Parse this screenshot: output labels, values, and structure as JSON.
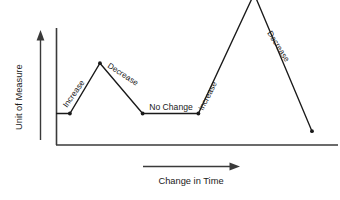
{
  "chart_data": {
    "type": "line",
    "title": "",
    "xlabel": "Change in Time",
    "ylabel": "Unit of Measure",
    "grid": false,
    "legend": "none",
    "axis_ticks": "none",
    "xlim": [
      0,
      100
    ],
    "ylim": [
      0,
      100
    ],
    "x": [
      0,
      5.4,
      17.1,
      33.7,
      55.4,
      77.1,
      99.6
    ],
    "y": [
      23.7,
      23.7,
      61.5,
      23.7,
      23.7,
      113.7,
      10.4
    ],
    "series": [
      {
        "name": "trend-line",
        "points": [
          {
            "x": 0,
            "y": 23.7
          },
          {
            "x": 5.4,
            "y": 23.7
          },
          {
            "x": 17.1,
            "y": 61.5
          },
          {
            "x": 33.7,
            "y": 23.7
          },
          {
            "x": 55.4,
            "y": 23.7
          },
          {
            "x": 77.1,
            "y": 113.7
          },
          {
            "x": 99.6,
            "y": 10.4
          }
        ]
      }
    ],
    "annotations": [
      {
        "text": "Increase",
        "segment": 1,
        "rotation": -55
      },
      {
        "text": "Decrease",
        "segment": 2,
        "rotation": 33
      },
      {
        "text": "No Change",
        "segment": 3,
        "rotation": 0
      },
      {
        "text": "Increase",
        "segment": 4,
        "rotation": -63
      },
      {
        "text": "Decrease",
        "segment": 5,
        "rotation": 58
      }
    ],
    "colors": {
      "line": "#1a1a1a",
      "axis": "#3a3a3a",
      "text": "#1a1a1a",
      "background": "#ffffff"
    }
  },
  "axes": {
    "y_title": "Unit of Measure",
    "x_title": "Change in Time"
  },
  "labels": {
    "increase_1": "Increase",
    "decrease_1": "Decrease",
    "no_change": "No Change",
    "increase_2": "Increase",
    "decrease_2": "Decrease"
  }
}
